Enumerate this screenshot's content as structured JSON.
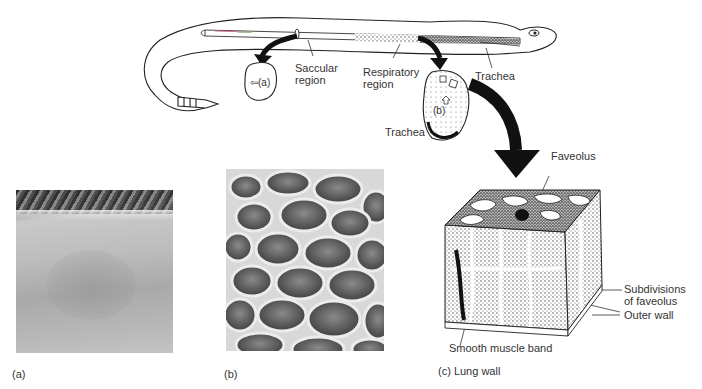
{
  "figure": {
    "labels": {
      "saccular_region_line1": "Saccular",
      "saccular_region_line2": "region",
      "respiratory_region_line1": "Respiratory",
      "respiratory_region_line2": "region",
      "trachea_head": "Trachea",
      "trachea_section": "Trachea",
      "inset_a": "(a)",
      "inset_b": "(b)",
      "faveolus": "Faveolus",
      "subdivisions_line1": "Subdivisions",
      "subdivisions_line2": "of faveolus",
      "outer_wall": "Outer wall",
      "smooth_muscle_band": "Smooth muscle band"
    },
    "panels": [
      {
        "id": "a",
        "caption": "(a)",
        "description": "SEM of saccular region lung wall (smooth)"
      },
      {
        "id": "b",
        "caption": "(b)",
        "description": "SEM of respiratory region honeycomb faveoli"
      },
      {
        "id": "c",
        "caption": "(c) Lung wall",
        "description": "3D block drawing of lung wall"
      }
    ]
  }
}
